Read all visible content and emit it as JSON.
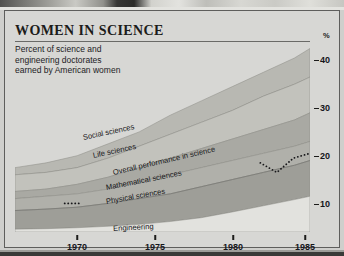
{
  "header": {
    "title": "WOMEN IN SCIENCE",
    "subtitle_lines": [
      "Percent of science and",
      "engineering doctorates",
      "earned by American women"
    ]
  },
  "axis": {
    "percent_symbol": "%",
    "y_ticks": [
      "40",
      "30",
      "20",
      "10"
    ],
    "x_ticks": [
      "1970",
      "1975",
      "1980",
      "1985"
    ]
  },
  "colors": {
    "background": "#d7d7d4",
    "band_social": "#b8b8b2",
    "band_life": "#c2c2bc",
    "band_overall": "#a9a9a3",
    "band_math": "#b0b0aa",
    "band_physical": "#9e9e98",
    "band_engineering": "#e2e2de",
    "axis_text": "#15151a",
    "frame": "#5e5e5c"
  },
  "chart_data": {
    "type": "area",
    "title": "WOMEN IN SCIENCE",
    "subtitle": "Percent of science and engineering doctorates earned by American women",
    "xlabel": "",
    "ylabel": "%",
    "xlim": [
      1966,
      1985
    ],
    "ylim": [
      0,
      43
    ],
    "x_tick_values": [
      1970,
      1975,
      1980,
      1985
    ],
    "y_tick_values": [
      10,
      20,
      30,
      40
    ],
    "grid": false,
    "legend": "inline-band-labels",
    "stacked": true,
    "x": [
      1966,
      1968,
      1970,
      1972,
      1974,
      1976,
      1978,
      1980,
      1982,
      1984,
      1985
    ],
    "series": [
      {
        "name": "Social sciences",
        "label": "Social sciences",
        "values": [
          13.5,
          14.5,
          16.0,
          18.5,
          21.0,
          24.5,
          27.5,
          30.5,
          33.5,
          36.5,
          38.5
        ]
      },
      {
        "name": "Life sciences",
        "label": "Life sciences",
        "values": [
          12.0,
          12.5,
          13.5,
          15.5,
          18.0,
          20.5,
          23.0,
          25.5,
          28.5,
          31.0,
          32.5
        ]
      },
      {
        "name": "Overall performance in science",
        "label": "Overall performance in science",
        "values": [
          8.5,
          9.0,
          10.0,
          11.5,
          13.5,
          15.5,
          17.5,
          19.5,
          21.5,
          23.5,
          25.0
        ]
      },
      {
        "name": "Mathematical sciences",
        "label": "Mathematical sciences",
        "values": [
          7.0,
          7.5,
          8.0,
          9.0,
          10.5,
          12.0,
          13.5,
          15.0,
          16.5,
          18.0,
          19.0
        ]
      },
      {
        "name": "Physical sciences",
        "label": "Physical sciences",
        "values": [
          4.5,
          4.8,
          5.2,
          6.0,
          7.0,
          8.0,
          9.5,
          11.0,
          12.5,
          14.0,
          15.0
        ]
      },
      {
        "name": "Engineering",
        "label": "Engineering",
        "values": [
          0.6,
          0.7,
          0.9,
          1.2,
          1.6,
          2.2,
          3.0,
          4.2,
          5.5,
          6.8,
          7.5
        ]
      }
    ],
    "annotations": [
      {
        "name": "dotted-marker-left",
        "type": "dotted-line",
        "x_range": [
          1969.2,
          1970.2
        ],
        "y": 6.0
      },
      {
        "name": "dotted-marker-right",
        "type": "dotted-line",
        "x_range": [
          1981.8,
          1985.0
        ],
        "y_values": [
          14.5,
          12.5,
          15.5,
          16.5
        ]
      }
    ]
  },
  "band_labels": [
    {
      "text": "Social sciences",
      "left": 78,
      "top": 122,
      "rotate": -12
    },
    {
      "text": "Life sciences",
      "left": 88,
      "top": 140,
      "rotate": -12
    },
    {
      "text": "Overall performance in science",
      "left": 108,
      "top": 157,
      "rotate": -13
    },
    {
      "text": "Mathematical sciences",
      "left": 101,
      "top": 172,
      "rotate": -11
    },
    {
      "text": "Physical sciences",
      "left": 101,
      "top": 186,
      "rotate": -10
    },
    {
      "text": "Engineering",
      "left": 108,
      "top": 213,
      "rotate": -3
    }
  ],
  "y_tick_positions": [
    {
      "label": "40",
      "top": 28
    },
    {
      "label": "30",
      "top": 76
    },
    {
      "label": "20",
      "top": 124
    },
    {
      "label": "10",
      "top": 172
    }
  ],
  "x_tick_positions": [
    {
      "label": "1970",
      "left": 62
    },
    {
      "label": "1975",
      "left": 140
    },
    {
      "label": "1980",
      "left": 218
    },
    {
      "label": "1985",
      "left": 290
    }
  ]
}
